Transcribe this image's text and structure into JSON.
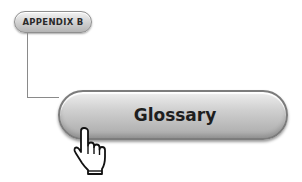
{
  "tag": {
    "label": "APPENDIX B"
  },
  "main_button": {
    "label": "Glossary"
  },
  "cursor": {
    "icon": "hand-pointer-icon"
  }
}
